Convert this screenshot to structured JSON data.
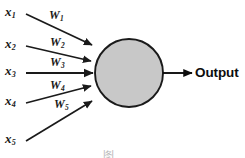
{
  "figure": {
    "type": "neural-network-neuron",
    "background_color": "#ffffff",
    "stroke_color": "#1a1a1a",
    "neuron_fill_color": "#c8c8c8",
    "neuron_border_color": "#1a1a1a"
  },
  "inputs": [
    {
      "id": "x1",
      "label": "x",
      "subscript": "1"
    },
    {
      "id": "x2",
      "label": "x",
      "subscript": "2"
    },
    {
      "id": "x3",
      "label": "x",
      "subscript": "3"
    },
    {
      "id": "x4",
      "label": "x",
      "subscript": "4"
    },
    {
      "id": "x5",
      "label": "x",
      "subscript": "5"
    }
  ],
  "weights": [
    {
      "id": "w1",
      "label": "W",
      "subscript": "1"
    },
    {
      "id": "w2",
      "label": "W",
      "subscript": "2"
    },
    {
      "id": "w3",
      "label": "W",
      "subscript": "3"
    },
    {
      "id": "w4",
      "label": "W",
      "subscript": "4"
    },
    {
      "id": "w5",
      "label": "W",
      "subscript": "5"
    }
  ],
  "output": {
    "label": "Output"
  },
  "caption_fragment": {
    "text": "图"
  }
}
